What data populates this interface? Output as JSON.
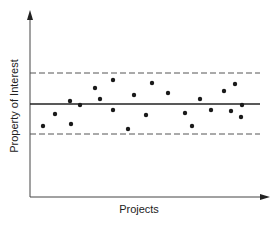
{
  "chart_data": {
    "type": "scatter",
    "title": "",
    "xlabel": "Projects",
    "ylabel": "Property of Interest",
    "grid": false,
    "legend": null,
    "axis_ticks": "none",
    "reference_lines": [
      {
        "name": "upper limit",
        "style": "dashed",
        "y": 73
      },
      {
        "name": "center line (mean)",
        "style": "solid",
        "y": 104
      },
      {
        "name": "lower limit",
        "style": "dashed",
        "y": 134
      }
    ],
    "points_pixel_note": "Unitless control-chart style scatter; points given in image pixel coords (x right, y down).",
    "points": [
      {
        "x": 43,
        "y": 126
      },
      {
        "x": 55,
        "y": 114
      },
      {
        "x": 70,
        "y": 101
      },
      {
        "x": 71,
        "y": 124
      },
      {
        "x": 80,
        "y": 105
      },
      {
        "x": 95,
        "y": 88
      },
      {
        "x": 100,
        "y": 99
      },
      {
        "x": 113,
        "y": 80
      },
      {
        "x": 113,
        "y": 110
      },
      {
        "x": 128,
        "y": 129
      },
      {
        "x": 134,
        "y": 95
      },
      {
        "x": 146,
        "y": 115
      },
      {
        "x": 152,
        "y": 83
      },
      {
        "x": 168,
        "y": 93
      },
      {
        "x": 185,
        "y": 113
      },
      {
        "x": 192,
        "y": 126
      },
      {
        "x": 200,
        "y": 99
      },
      {
        "x": 211,
        "y": 110
      },
      {
        "x": 224,
        "y": 91
      },
      {
        "x": 231,
        "y": 111
      },
      {
        "x": 235,
        "y": 84
      },
      {
        "x": 242,
        "y": 105
      },
      {
        "x": 241,
        "y": 117
      }
    ],
    "colors": {
      "axis": "#333333",
      "points": "#1a1a1a",
      "lines": "#444444"
    }
  },
  "labels": {
    "x_axis": "Projects",
    "y_axis": "Property of Interest"
  }
}
